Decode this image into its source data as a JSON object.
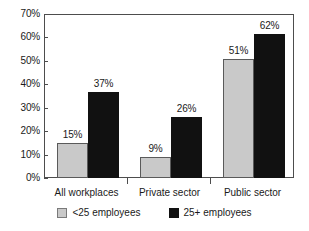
{
  "chart_data": {
    "type": "bar",
    "title": "",
    "subtitle": "",
    "xlabel": "",
    "ylabel": "",
    "categories": [
      "All workplaces",
      "Private sector",
      "Public sector"
    ],
    "series": [
      {
        "name": "<25 employees",
        "color": "#c9c9c9",
        "values": [
          15,
          9,
          51
        ],
        "value_labels": [
          "15%",
          "9%",
          "51%"
        ]
      },
      {
        "name": "25+ employees",
        "color": "#111111",
        "values": [
          37,
          26,
          62
        ],
        "value_labels": [
          "37%",
          "26%",
          "62%"
        ]
      }
    ],
    "ylim": [
      0,
      70
    ],
    "y_tick_values": [
      0,
      10,
      20,
      30,
      40,
      50,
      60,
      70
    ],
    "y_tick_labels": [
      "0%",
      "10%",
      "20%",
      "30%",
      "40%",
      "50%",
      "60%",
      "70%"
    ],
    "grid": false,
    "legend_position": "bottom",
    "legend": [
      "<25 employees",
      "25+ employees"
    ],
    "annotations": []
  },
  "axis": {
    "y_labels": [
      "70%",
      "60%",
      "50%",
      "40%",
      "30%",
      "20%",
      "10%",
      "0%"
    ]
  },
  "categories": [
    {
      "label": "All workplaces"
    },
    {
      "label": "Private sector"
    },
    {
      "label": "Public sector"
    }
  ],
  "bars": [
    {
      "value_label": "15%"
    },
    {
      "value_label": "37%"
    },
    {
      "value_label": "9%"
    },
    {
      "value_label": "26%"
    },
    {
      "value_label": "51%"
    },
    {
      "value_label": "62%"
    }
  ],
  "legend": {
    "items": [
      {
        "label": "<25 employees"
      },
      {
        "label": "25+ employees"
      }
    ]
  },
  "colors": {
    "series_small": "#c9c9c9",
    "series_large": "#111111",
    "axis": "#4d4d4d",
    "text": "#1a1a1a",
    "background": "#ffffff"
  }
}
